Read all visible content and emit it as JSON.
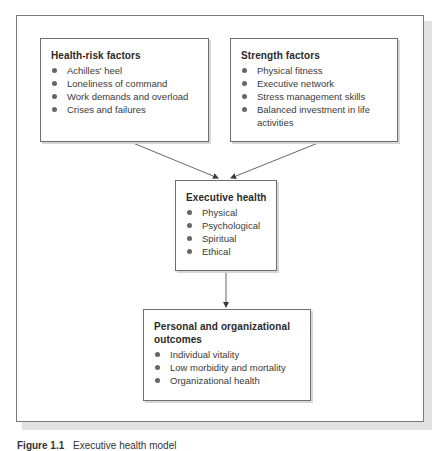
{
  "diagram": {
    "boxes": {
      "health_risk": {
        "title": "Health-risk factors",
        "items": [
          "Achilles' heel",
          "Loneliness of command",
          "Work demands and overload",
          "Crises and failures"
        ]
      },
      "strength": {
        "title": "Strength factors",
        "items": [
          "Physical fitness",
          "Executive network",
          "Stress management skills",
          "Balanced investment in life activities"
        ]
      },
      "executive_health": {
        "title": "Executive health",
        "items": [
          "Physical",
          "Psychological",
          "Spiritual",
          "Ethical"
        ]
      },
      "outcomes": {
        "title": "Personal and organizational outcomes",
        "items": [
          "Individual vitality",
          "Low morbidity and mortality",
          "Organizational health"
        ]
      }
    },
    "edges": [
      {
        "from": "health_risk",
        "to": "executive_health"
      },
      {
        "from": "strength",
        "to": "executive_health"
      },
      {
        "from": "executive_health",
        "to": "outcomes"
      }
    ],
    "caption": {
      "number": "Figure 1.1",
      "text": "Executive health model"
    },
    "colors": {
      "border": "#6f6f6f",
      "bullet": "#666666",
      "shadow": "#e2e2e2",
      "text": "#2e2e2e"
    }
  }
}
